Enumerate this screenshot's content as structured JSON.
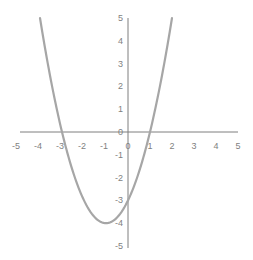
{
  "chart_data": {
    "type": "line",
    "title": "",
    "xlabel": "",
    "ylabel": "",
    "function": "y = x^2 + 2x - 3",
    "xlim": [
      -5,
      5
    ],
    "ylim": [
      -5,
      5
    ],
    "grid": false,
    "legend": null,
    "x_ticks": [
      "-5",
      "-4",
      "-3",
      "-2",
      "-1",
      "0",
      "1",
      "2",
      "3",
      "4",
      "5"
    ],
    "y_ticks": [
      "5",
      "4",
      "3",
      "2",
      "1",
      "0",
      "-1",
      "-2",
      "-3",
      "-4",
      "-5"
    ],
    "series": [
      {
        "name": "y",
        "color": "#a6a6a6",
        "x": [
          -4,
          -3.5,
          -3,
          -2.5,
          -2,
          -1.5,
          -1,
          -0.5,
          0,
          0.5,
          1,
          1.5,
          2
        ],
        "y": [
          5,
          2.25,
          0,
          -1.75,
          -3,
          -3.75,
          -4,
          -3.75,
          -3,
          -1.75,
          0,
          2.25,
          5
        ]
      }
    ]
  },
  "colors": {
    "axis": "#7f7f7f",
    "curve": "#a6a6a6",
    "background": "#ffffff"
  }
}
